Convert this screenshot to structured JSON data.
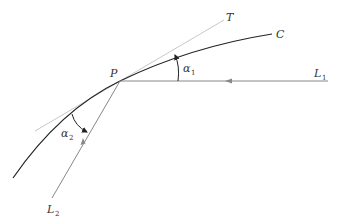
{
  "diagram": {
    "labels": {
      "point": "P",
      "tangent": "T",
      "curve": "C",
      "line1": "L",
      "line1_sub": "1",
      "line2": "L",
      "line2_sub": "2",
      "angle1": "α",
      "angle1_sub": "1",
      "angle2": "α",
      "angle2_sub": "2"
    },
    "colors": {
      "curve": "#222222",
      "tangent": "#c8c8c8",
      "lines": "#888888",
      "text": "#333333"
    }
  }
}
